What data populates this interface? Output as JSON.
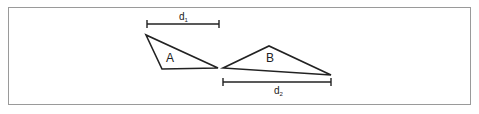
{
  "diagram": {
    "shapes": [
      {
        "label": "A",
        "vertices": [
          [
            146,
            35
          ],
          [
            162,
            69
          ],
          [
            218,
            68
          ]
        ]
      },
      {
        "label": "B",
        "vertices": [
          [
            223,
            68
          ],
          [
            269,
            46
          ],
          [
            331,
            75
          ]
        ]
      }
    ],
    "dimensions": [
      {
        "label": "d",
        "subscript": "1",
        "x1": 147,
        "x2": 219,
        "y": 24
      },
      {
        "label": "d",
        "subscript": "2",
        "x1": 223,
        "x2": 331,
        "y": 82
      }
    ],
    "colors": {
      "stroke": "#222222",
      "border": "#9a9a9a"
    }
  }
}
